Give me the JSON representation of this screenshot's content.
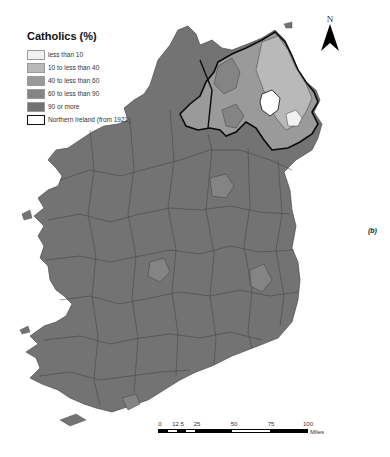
{
  "legend": {
    "title": "Catholics (%)",
    "items": [
      {
        "label": "less than 10",
        "color": "#f1f1f1"
      },
      {
        "label": "10 to less than 40",
        "color": "#b9b9b9"
      },
      {
        "label": "40 to less than 60",
        "color": "#9a9a9a"
      },
      {
        "label": "60 to less than 90",
        "color": "#848484"
      },
      {
        "label": "90 or more",
        "color": "#727272"
      },
      {
        "label": "Northern Ireland (from 1921)",
        "color": "#ffffff",
        "outline": "#111111"
      }
    ]
  },
  "north_arrow": {
    "letter": "N"
  },
  "panel_label": "(b)",
  "scale_bar": {
    "ticks": [
      "0",
      "12.5",
      "25",
      "50",
      "75",
      "100"
    ],
    "unit": "Miles"
  },
  "colors": {
    "island_base": "#737373",
    "boundary": "#3e3e3e",
    "ni_outline": "#0a0a0a",
    "water": "#ffffff"
  }
}
